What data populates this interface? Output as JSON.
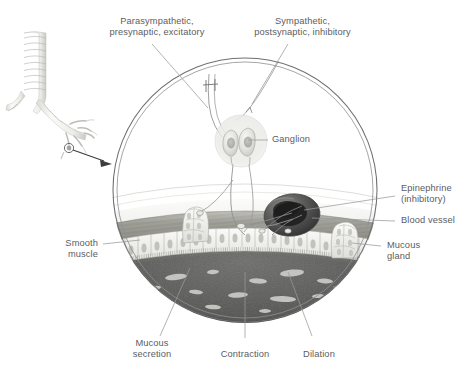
{
  "figure": {
    "colors": {
      "text": "#5d5d5f",
      "leader_line": "#8e8e90",
      "circle_border": "#6f6f72",
      "lumen_dark": "#4a4a4c",
      "mucus_light": "#d9d9d6",
      "vessel_dark": "#3f3f41",
      "muscle": "#9a9a96",
      "epithelium": "#e8e8e4",
      "cartilage": "#ececeb"
    }
  },
  "labels": {
    "parasympathetic": "Parasympathetic,\npresynaptic, excitatory",
    "sympathetic": "Sympathetic,\npostsynaptic, inhibitory",
    "ganglion": "Ganglion",
    "epinephrine": "Epinephrine\n(inhibitory)",
    "blood_vessel": "Blood vessel",
    "mucous_gland": "Mucous\ngland",
    "smooth_muscle": "Smooth\nmuscle",
    "mucous_secretion": "Mucous\nsecretion",
    "contraction": "Contraction",
    "dilation": "Dilation"
  },
  "inset": {
    "name": "bronchial-tree",
    "description": "trachea with cartilage rings branching into bronchi, magnified region marked"
  },
  "structures": [
    {
      "id": "ganglion",
      "label": "Ganglion",
      "neurons": 2
    },
    {
      "id": "blood-vessel",
      "label": "Blood vessel"
    },
    {
      "id": "mucous-gland-left",
      "label": "Mucous gland"
    },
    {
      "id": "mucous-gland-right",
      "label": "Mucous gland"
    },
    {
      "id": "smooth-muscle",
      "label": "Smooth muscle"
    },
    {
      "id": "epithelium",
      "label": "Ciliated epithelium"
    },
    {
      "id": "lumen",
      "label": "Airway lumen with mucus"
    }
  ]
}
